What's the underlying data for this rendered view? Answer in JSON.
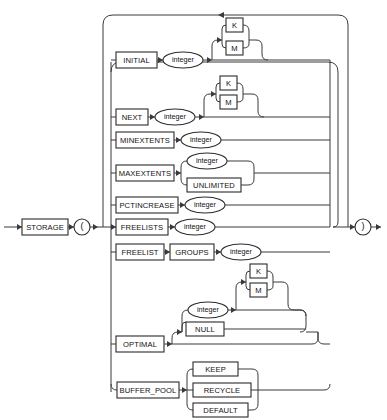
{
  "diagram": {
    "type": "railroad-syntax-diagram",
    "colors": {
      "background": "#ffffff",
      "line": "#3a3a3a",
      "box_stroke": "#2b2b2b",
      "text": "#111111"
    },
    "entry_keyword": "STORAGE",
    "open_paren": "(",
    "close_paren": ")",
    "options": [
      {
        "id": "initial",
        "keyword": "INITIAL",
        "argument": "integer",
        "argument_kind": "oval",
        "suffixes": [
          "K",
          "M"
        ],
        "suffix_optional": true
      },
      {
        "id": "next",
        "keyword": "NEXT",
        "argument": "integer",
        "argument_kind": "oval",
        "suffixes": [
          "K",
          "M"
        ],
        "suffix_optional": true
      },
      {
        "id": "minextents",
        "keyword": "MINEXTENTS",
        "argument": "integer",
        "argument_kind": "oval",
        "suffixes": [],
        "suffix_optional": false
      },
      {
        "id": "maxextents",
        "keyword": "MAXEXTENTS",
        "argument": null,
        "argument_kind": "choice",
        "choices": [
          {
            "label": "integer",
            "kind": "oval"
          },
          {
            "label": "UNLIMITED",
            "kind": "box"
          }
        ]
      },
      {
        "id": "pctincrease",
        "keyword": "PCTINCREASE",
        "argument": "integer",
        "argument_kind": "oval",
        "suffixes": [],
        "suffix_optional": false
      },
      {
        "id": "freelists",
        "keyword": "FREELISTS",
        "argument": "integer",
        "argument_kind": "oval",
        "suffixes": [],
        "suffix_optional": false
      },
      {
        "id": "freelist-groups",
        "keyword": "FREELIST",
        "keyword2": "GROUPS",
        "argument": "integer",
        "argument_kind": "oval",
        "suffixes": [],
        "suffix_optional": false
      },
      {
        "id": "optimal",
        "keyword": "OPTIMAL",
        "argument": null,
        "argument_kind": "choice-optional",
        "choices": [
          {
            "label": "integer",
            "kind": "oval"
          },
          {
            "label": "NULL",
            "kind": "box"
          }
        ],
        "suffixes": [
          "K",
          "M"
        ],
        "suffix_optional": true
      },
      {
        "id": "buffer-pool",
        "keyword": "BUFFER_POOL",
        "argument": null,
        "argument_kind": "choice",
        "choices": [
          {
            "label": "KEEP",
            "kind": "box"
          },
          {
            "label": "RECYCLE",
            "kind": "box"
          },
          {
            "label": "DEFAULT",
            "kind": "box"
          }
        ]
      }
    ],
    "terminals": {
      "K": "K",
      "M": "M",
      "UNLIMITED": "UNLIMITED",
      "NULL": "NULL",
      "KEEP": "KEEP",
      "RECYCLE": "RECYCLE",
      "DEFAULT": "DEFAULT",
      "GROUPS": "GROUPS",
      "integer": "integer"
    }
  }
}
